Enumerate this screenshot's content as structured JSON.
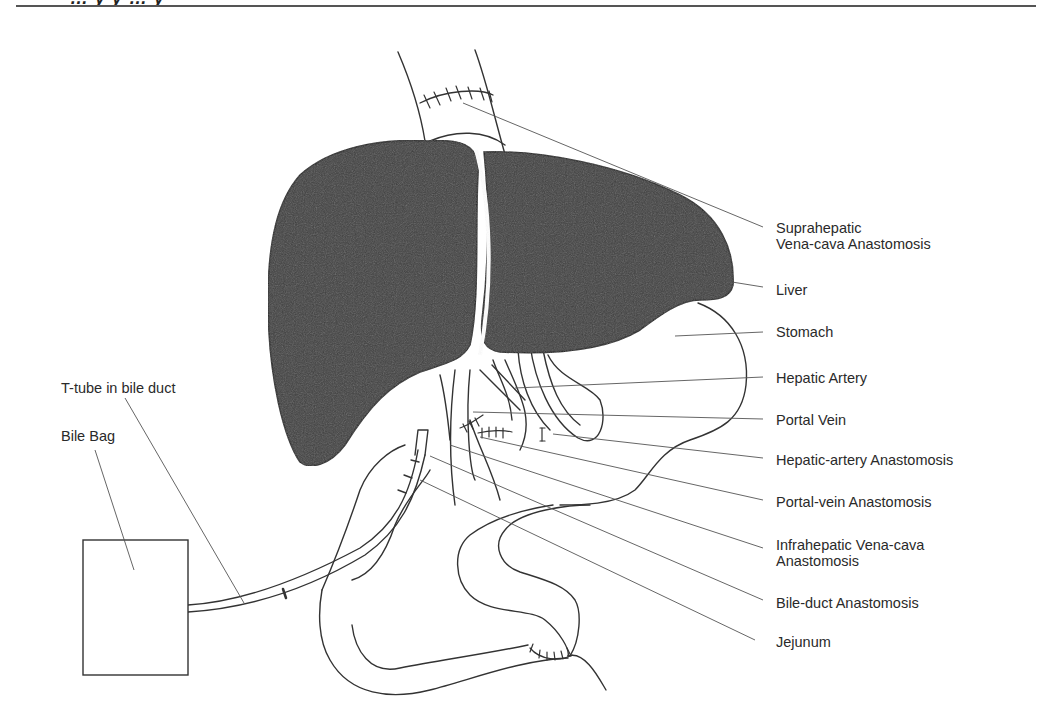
{
  "header": {
    "cropped_title_fragment": "… y y … y"
  },
  "figure": {
    "type": "anatomical illustration",
    "colors": {
      "liver_fill": "#3e3e3e",
      "line": "#333333",
      "leader": "#555555",
      "background": "#ffffff"
    },
    "labels_right": [
      {
        "id": "suprahepatic",
        "lines": [
          "Suprahepatic",
          "Vena-cava Anastomosis"
        ]
      },
      {
        "id": "liver",
        "lines": [
          "Liver"
        ]
      },
      {
        "id": "stomach",
        "lines": [
          "Stomach"
        ]
      },
      {
        "id": "hepatic-artery",
        "lines": [
          "Hepatic Artery"
        ]
      },
      {
        "id": "portal-vein",
        "lines": [
          "Portal Vein"
        ]
      },
      {
        "id": "hepatic-artery-anastomosis",
        "lines": [
          "Hepatic-artery Anastomosis"
        ]
      },
      {
        "id": "portal-vein-anastomosis",
        "lines": [
          "Portal-vein Anastomosis"
        ]
      },
      {
        "id": "infrahepatic",
        "lines": [
          "Infrahepatic Vena-cava",
          "Anastomosis"
        ]
      },
      {
        "id": "bile-duct-anastomosis",
        "lines": [
          "Bile-duct Anastomosis"
        ]
      },
      {
        "id": "jejunum",
        "lines": [
          "Jejunum"
        ]
      }
    ],
    "labels_left": [
      {
        "id": "t-tube",
        "lines": [
          "T-tube in bile duct"
        ]
      },
      {
        "id": "bile-bag",
        "lines": [
          "Bile Bag"
        ]
      }
    ]
  }
}
